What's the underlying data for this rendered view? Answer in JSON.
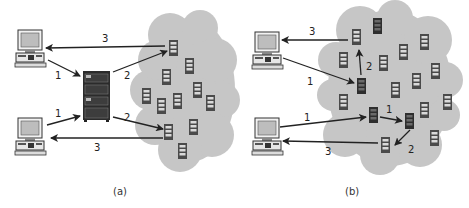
{
  "colors": {
    "cloud": "#c6c6c6",
    "arrow": "#222222",
    "server_dark": "#3a3a3a",
    "server_light": "#5a5a5a",
    "server_slot": "#d9d9d9"
  },
  "panels": [
    {
      "id": "a",
      "caption": "(a)",
      "description": "Centralized directory server: clients query a central server which forwards to peers in the cloud",
      "clients": [
        "client-top",
        "client-bottom"
      ],
      "central_server": true,
      "arrow_labels": {
        "top_return": "3",
        "top_request": "1",
        "top_forward": "2",
        "bottom_request": "1",
        "bottom_forward": "2",
        "bottom_return": "3"
      }
    },
    {
      "id": "b",
      "caption": "(b)",
      "description": "Decentralized: clients query peers in the cloud directly, which forward among themselves",
      "clients": [
        "client-top",
        "client-bottom"
      ],
      "central_server": false,
      "arrow_labels": {
        "top_return": "3",
        "top_request": "1",
        "top_forward": "2",
        "bottom_request": "1",
        "peer_forward": "1",
        "peer_forward_2": "2",
        "bottom_return": "3"
      }
    }
  ]
}
